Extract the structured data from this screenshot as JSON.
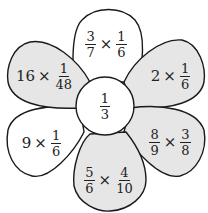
{
  "colors": {
    "shaded": "#e6e6e6",
    "white": "#ffffff",
    "stroke": "#1a1a1a"
  },
  "center": {
    "num": "1",
    "den": "3"
  },
  "petals": [
    {
      "id": "top",
      "shaded": false,
      "left": {
        "num": "3",
        "den": "7"
      },
      "op": "×",
      "right": {
        "num": "1",
        "den": "6"
      }
    },
    {
      "id": "upper-right",
      "shaded": true,
      "left": {
        "whole": "2"
      },
      "op": "×",
      "right": {
        "num": "1",
        "den": "6"
      }
    },
    {
      "id": "lower-right",
      "shaded": true,
      "left": {
        "num": "8",
        "den": "9"
      },
      "op": "×",
      "right": {
        "num": "3",
        "den": "8"
      }
    },
    {
      "id": "bottom",
      "shaded": true,
      "left": {
        "num": "5",
        "den": "6"
      },
      "op": "×",
      "right": {
        "num": "4",
        "den": "10"
      }
    },
    {
      "id": "lower-left",
      "shaded": false,
      "left": {
        "whole": "9"
      },
      "op": "×",
      "right": {
        "num": "1",
        "den": "6"
      }
    },
    {
      "id": "upper-left",
      "shaded": true,
      "left": {
        "whole": "16"
      },
      "op": "×",
      "right": {
        "num": "1",
        "den": "48"
      }
    }
  ]
}
